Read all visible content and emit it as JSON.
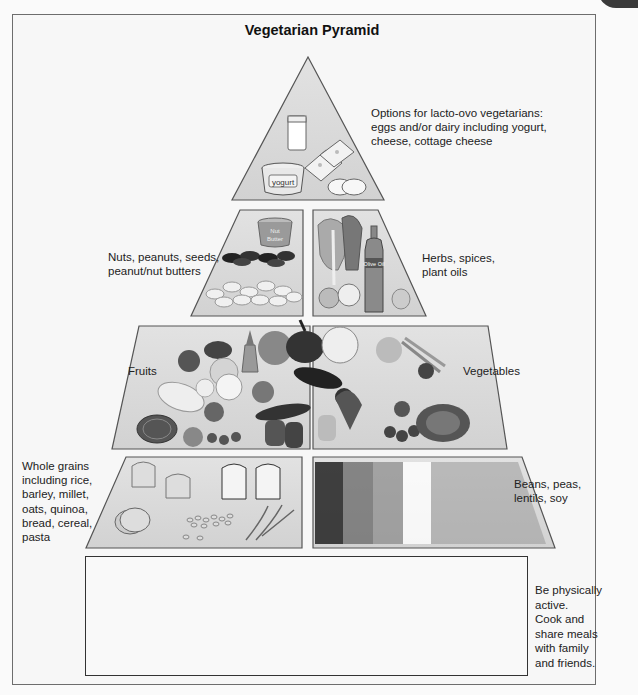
{
  "title": "Vegetarian Pyramid",
  "tiers": {
    "top": {
      "label": "Options for lacto-ovo vegetarians:\neggs and/or dairy including yogurt,\ncheese, cottage cheese",
      "items": [
        "milk glass",
        "yogurt",
        "cheese slices",
        "eggs"
      ],
      "yogurt_text": "yogurt"
    },
    "second_left": {
      "label": "Nuts, peanuts, seeds,\npeanut/nut butters",
      "items": [
        "nut butter jar",
        "seeds",
        "peanuts"
      ],
      "jar_text": "Nut Butter"
    },
    "second_right": {
      "label": "Herbs, spices,\nplant oils",
      "items": [
        "leafy herbs",
        "olive oil bottle",
        "garlic",
        "onion"
      ],
      "bottle_text": "Olive Oil"
    },
    "third_left": {
      "label": "Fruits",
      "items": [
        "apple",
        "grapes",
        "pineapple",
        "orange",
        "banana",
        "lemon",
        "watermelon",
        "plums",
        "blueberries",
        "tomato"
      ]
    },
    "third_right": {
      "label": "Vegetables",
      "items": [
        "pumpkin",
        "cauliflower",
        "eggplant",
        "carrots",
        "beet",
        "broccoli",
        "radishes",
        "cabbage",
        "peppers",
        "cucumber"
      ]
    },
    "bottom_left": {
      "label": "Whole grains\nincluding rice,\nbarley, millet,\noats, quinoa,\nbread, cereal,\npasta",
      "items": [
        "bread rolls",
        "bread slices",
        "crackers",
        "rice/grains",
        "wheat stalks"
      ]
    },
    "bottom_right": {
      "label": "Beans, peas,\nlentils, soy",
      "items": [
        "black beans",
        "kidney beans",
        "pinto beans",
        "white beans",
        "lentils"
      ]
    }
  },
  "activity": {
    "label": "Be physically\nactive.\nCook and\nshare meals\nwith family\nand friends.",
    "figures": [
      "walking woman",
      "exercise on mat",
      "cyclist",
      "man sweeping with rake"
    ]
  },
  "colors": {
    "tier_fill": "#d9d9d9",
    "tier_stroke": "#555555",
    "frame_stroke": "#6d6d6d"
  }
}
